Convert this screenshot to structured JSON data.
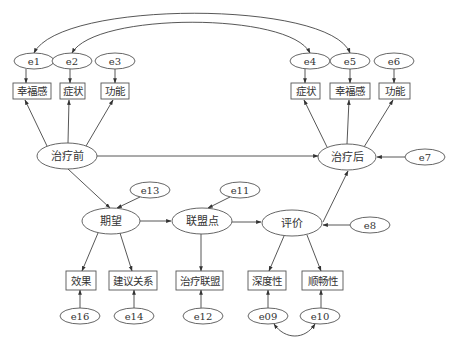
{
  "diagram": {
    "type": "structural-equation-model",
    "latent_nodes": [
      {
        "id": "pre",
        "label": "治疗前",
        "cx": 67,
        "cy": 156,
        "rx": 30,
        "ry": 13
      },
      {
        "id": "post",
        "label": "治疗后",
        "cx": 347,
        "cy": 157,
        "rx": 29,
        "ry": 13
      },
      {
        "id": "expect",
        "label": "期望",
        "cx": 111,
        "cy": 221,
        "rx": 29,
        "ry": 13
      },
      {
        "id": "alliance",
        "label": "联盟点",
        "cx": 202,
        "cy": 221,
        "rx": 30,
        "ry": 13
      },
      {
        "id": "eval",
        "label": "评价",
        "cx": 292,
        "cy": 223,
        "rx": 30,
        "ry": 13
      }
    ],
    "observed_nodes": [
      {
        "id": "pre_happy",
        "label": "幸福感",
        "x": 13,
        "y": 83,
        "w": 38,
        "h": 16
      },
      {
        "id": "pre_symptom",
        "label": "症状",
        "x": 60,
        "y": 83,
        "w": 25,
        "h": 16
      },
      {
        "id": "pre_function",
        "label": "功能",
        "x": 101,
        "y": 83,
        "w": 28,
        "h": 16
      },
      {
        "id": "post_symptom",
        "label": "症状",
        "x": 291,
        "y": 83,
        "w": 29,
        "h": 16
      },
      {
        "id": "post_happy",
        "label": "幸福感",
        "x": 330,
        "y": 83,
        "w": 40,
        "h": 16
      },
      {
        "id": "post_function",
        "label": "功能",
        "x": 379,
        "y": 83,
        "w": 31,
        "h": 16
      },
      {
        "id": "effect",
        "label": "效果",
        "x": 66,
        "y": 271,
        "w": 30,
        "h": 19
      },
      {
        "id": "advice",
        "label": "建议关系",
        "x": 109,
        "y": 271,
        "w": 48,
        "h": 19
      },
      {
        "id": "treat_alliance",
        "label": "治疗联盟",
        "x": 176,
        "y": 271,
        "w": 47,
        "h": 19
      },
      {
        "id": "depth",
        "label": "深度性",
        "x": 248,
        "y": 271,
        "w": 38,
        "h": 19
      },
      {
        "id": "smooth",
        "label": "顺畅性",
        "x": 302,
        "y": 271,
        "w": 41,
        "h": 19
      }
    ],
    "error_nodes": [
      {
        "id": "e1",
        "label": "e1",
        "cx": 34,
        "cy": 61,
        "rx": 20,
        "ry": 8
      },
      {
        "id": "e2",
        "label": "e2",
        "cx": 72,
        "cy": 61,
        "rx": 20,
        "ry": 8
      },
      {
        "id": "e3",
        "label": "e3",
        "cx": 115,
        "cy": 61,
        "rx": 20,
        "ry": 8
      },
      {
        "id": "e4",
        "label": "e4",
        "cx": 310,
        "cy": 61,
        "rx": 20,
        "ry": 8
      },
      {
        "id": "e5",
        "label": "e5",
        "cx": 350,
        "cy": 61,
        "rx": 20,
        "ry": 8
      },
      {
        "id": "e6",
        "label": "e6",
        "cx": 394,
        "cy": 61,
        "rx": 20,
        "ry": 8
      },
      {
        "id": "e7",
        "label": "e7",
        "cx": 425,
        "cy": 157,
        "rx": 20,
        "ry": 8
      },
      {
        "id": "e8",
        "label": "e8",
        "cx": 370,
        "cy": 225,
        "rx": 20,
        "ry": 8
      },
      {
        "id": "e11",
        "label": "e11",
        "cx": 240,
        "cy": 190,
        "rx": 20,
        "ry": 8
      },
      {
        "id": "e13",
        "label": "e13",
        "cx": 150,
        "cy": 190,
        "rx": 20,
        "ry": 8
      },
      {
        "id": "e16",
        "label": "e16",
        "cx": 80,
        "cy": 316,
        "rx": 20,
        "ry": 8
      },
      {
        "id": "e14",
        "label": "e14",
        "cx": 134,
        "cy": 316,
        "rx": 20,
        "ry": 8
      },
      {
        "id": "e12",
        "label": "e12",
        "cx": 203,
        "cy": 316,
        "rx": 20,
        "ry": 8
      },
      {
        "id": "e09",
        "label": "e09",
        "cx": 268,
        "cy": 316,
        "rx": 20,
        "ry": 8
      },
      {
        "id": "e10",
        "label": "e10",
        "cx": 320,
        "cy": 316,
        "rx": 20,
        "ry": 8
      }
    ],
    "edges": [
      {
        "from": "e1",
        "to": "pre_happy",
        "kind": "directed"
      },
      {
        "from": "e2",
        "to": "pre_symptom",
        "kind": "directed"
      },
      {
        "from": "e3",
        "to": "pre_function",
        "kind": "directed"
      },
      {
        "from": "pre",
        "to": "pre_happy",
        "kind": "directed"
      },
      {
        "from": "pre",
        "to": "pre_symptom",
        "kind": "directed"
      },
      {
        "from": "pre",
        "to": "pre_function",
        "kind": "directed"
      },
      {
        "from": "e4",
        "to": "post_symptom",
        "kind": "directed"
      },
      {
        "from": "e5",
        "to": "post_happy",
        "kind": "directed"
      },
      {
        "from": "e6",
        "to": "post_function",
        "kind": "directed"
      },
      {
        "from": "post",
        "to": "post_symptom",
        "kind": "directed"
      },
      {
        "from": "post",
        "to": "post_happy",
        "kind": "directed"
      },
      {
        "from": "post",
        "to": "post_function",
        "kind": "directed"
      },
      {
        "from": "pre",
        "to": "post",
        "kind": "directed"
      },
      {
        "from": "e7",
        "to": "post",
        "kind": "directed"
      },
      {
        "from": "pre",
        "to": "expect",
        "kind": "directed"
      },
      {
        "from": "e13",
        "to": "expect",
        "kind": "directed"
      },
      {
        "from": "expect",
        "to": "alliance",
        "kind": "directed"
      },
      {
        "from": "e11",
        "to": "alliance",
        "kind": "directed"
      },
      {
        "from": "alliance",
        "to": "eval",
        "kind": "directed"
      },
      {
        "from": "e8",
        "to": "eval",
        "kind": "directed"
      },
      {
        "from": "eval",
        "to": "post",
        "kind": "directed"
      },
      {
        "from": "expect",
        "to": "effect",
        "kind": "directed"
      },
      {
        "from": "expect",
        "to": "advice",
        "kind": "directed"
      },
      {
        "from": "alliance",
        "to": "treat_alliance",
        "kind": "directed"
      },
      {
        "from": "eval",
        "to": "depth",
        "kind": "directed"
      },
      {
        "from": "eval",
        "to": "smooth",
        "kind": "directed"
      },
      {
        "from": "e16",
        "to": "effect",
        "kind": "directed"
      },
      {
        "from": "e14",
        "to": "advice",
        "kind": "directed"
      },
      {
        "from": "e12",
        "to": "treat_alliance",
        "kind": "directed"
      },
      {
        "from": "e09",
        "to": "depth",
        "kind": "directed"
      },
      {
        "from": "e10",
        "to": "smooth",
        "kind": "directed"
      },
      {
        "from": "e1",
        "to": "e5",
        "kind": "covariance"
      },
      {
        "from": "e2",
        "to": "e4",
        "kind": "covariance"
      },
      {
        "from": "e09",
        "to": "e10",
        "kind": "covariance"
      }
    ]
  }
}
